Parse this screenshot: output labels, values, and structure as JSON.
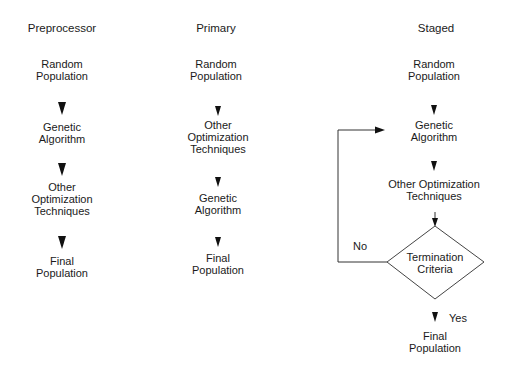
{
  "columns": [
    {
      "title": "Preprocessor",
      "steps": [
        {
          "line1": "Random",
          "line2": "Population"
        },
        {
          "line1": "Genetic",
          "line2": "Algorithm"
        },
        {
          "line1": "Other",
          "line2": "Optimization",
          "line3": "Techniques"
        },
        {
          "line1": "Final",
          "line2": "Population"
        }
      ]
    },
    {
      "title": "Primary",
      "steps": [
        {
          "line1": "Random",
          "line2": "Population"
        },
        {
          "line1": "Other",
          "line2": "Optimization",
          "line3": "Techniques"
        },
        {
          "line1": "Genetic",
          "line2": "Algorithm"
        },
        {
          "line1": "Final",
          "line2": "Population"
        }
      ]
    },
    {
      "title": "Staged",
      "steps": [
        {
          "line1": "Random",
          "line2": "Population"
        },
        {
          "line1": "Genetic",
          "line2": "Algorithm"
        },
        {
          "line1": "Other Optimization",
          "line2": "Techniques"
        },
        {
          "line1": "Termination",
          "line2": "Criteria"
        },
        {
          "line1": "Final",
          "line2": "Population"
        }
      ],
      "no_label": "No",
      "yes_label": "Yes"
    }
  ]
}
